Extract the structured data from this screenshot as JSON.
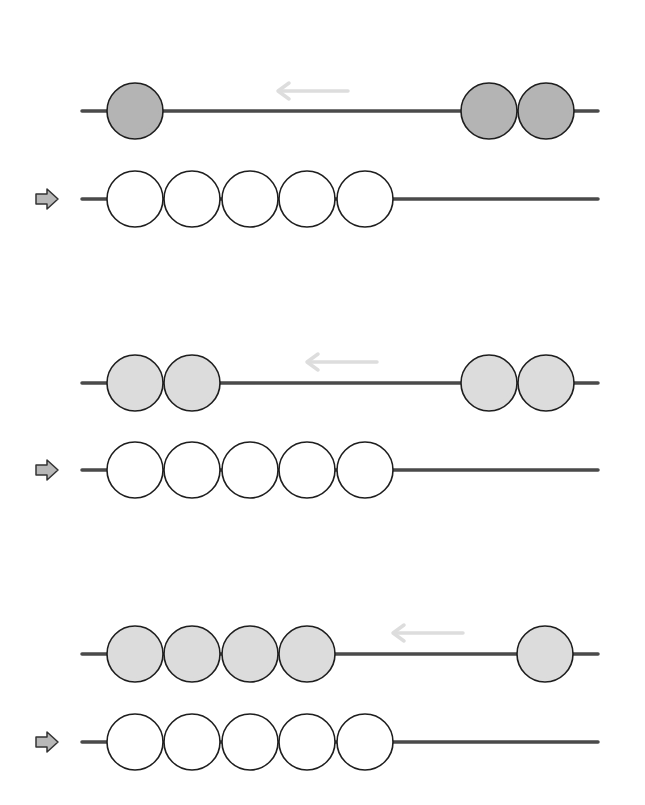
{
  "colors": {
    "rod": "#4a4a4a",
    "bead_stroke": "#1e1e1e",
    "bead_dark": "#b4b4b4",
    "bead_dark_shade": "#a2a2a2",
    "bead_light": "#dcdcdc",
    "bead_light_shade": "#cacaca",
    "bead_white": "#ffffff",
    "bead_white_shade": "#ececec",
    "move_arrow": "#dddddd",
    "pointer_fill": "#b8b8b8",
    "pointer_stroke": "#333333"
  },
  "rod": {
    "x_start": 82,
    "x_end": 598
  },
  "bead_radius": 28,
  "exercises": [
    {
      "id": 1,
      "top_rod": {
        "y": 111,
        "bead_tone": "dark",
        "beads_x": [
          135,
          489,
          546
        ],
        "move_arrow": {
          "x_from": 348,
          "x_to": 278,
          "y": 91,
          "direction": "left"
        }
      },
      "bottom_rod": {
        "y": 199,
        "bead_tone": "white",
        "beads_x": [
          135,
          192,
          250,
          307,
          365
        ],
        "pointer": {
          "x": 36,
          "y": 199
        }
      }
    },
    {
      "id": 2,
      "top_rod": {
        "y": 383,
        "bead_tone": "light",
        "beads_x": [
          135,
          192,
          489,
          546
        ],
        "move_arrow": {
          "x_from": 377,
          "x_to": 307,
          "y": 362,
          "direction": "left"
        }
      },
      "bottom_rod": {
        "y": 470,
        "bead_tone": "white",
        "beads_x": [
          135,
          192,
          250,
          307,
          365
        ],
        "pointer": {
          "x": 36,
          "y": 470
        }
      }
    },
    {
      "id": 3,
      "top_rod": {
        "y": 654,
        "bead_tone": "light",
        "beads_x": [
          135,
          192,
          250,
          307,
          545
        ],
        "move_arrow": {
          "x_from": 463,
          "x_to": 393,
          "y": 633,
          "direction": "left"
        }
      },
      "bottom_rod": {
        "y": 742,
        "bead_tone": "white",
        "beads_x": [
          135,
          192,
          250,
          307,
          365
        ],
        "pointer": {
          "x": 36,
          "y": 742
        }
      }
    }
  ]
}
